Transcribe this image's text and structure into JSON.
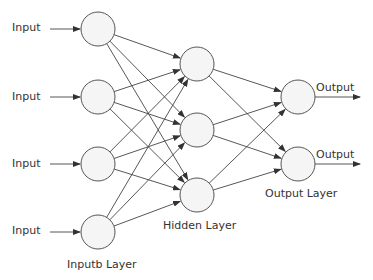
{
  "diagram": {
    "colors": {
      "node_fill": "#f5f5f5",
      "node_stroke": "#555555",
      "edge": "#444444",
      "text": "#333333"
    },
    "input_labels": [
      "Input",
      "Input",
      "Input",
      "Input"
    ],
    "output_labels": [
      "Output",
      "Output"
    ],
    "layer_labels": {
      "input": "Inputb Layer",
      "hidden": "Hidden Layer",
      "output": "Output Layer"
    },
    "layers": {
      "input": [
        {
          "x": 98,
          "y": 29
        },
        {
          "x": 98,
          "y": 97
        },
        {
          "x": 98,
          "y": 164
        },
        {
          "x": 98,
          "y": 232
        }
      ],
      "hidden": [
        {
          "x": 197,
          "y": 64
        },
        {
          "x": 197,
          "y": 130
        },
        {
          "x": 197,
          "y": 195
        }
      ],
      "output": [
        {
          "x": 298,
          "y": 97
        },
        {
          "x": 298,
          "y": 164
        }
      ]
    },
    "node_radius": 17,
    "connections": "fully-connected input->hidden->output"
  }
}
